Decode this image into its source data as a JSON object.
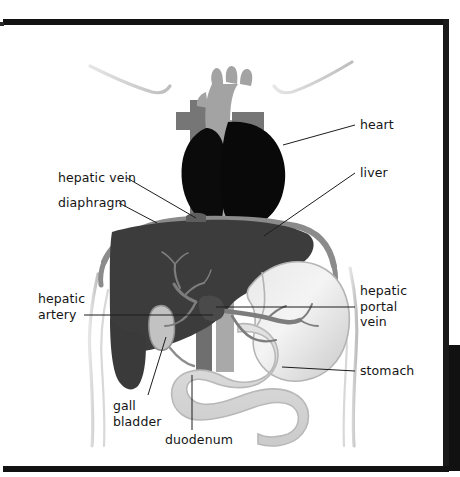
{
  "figure": {
    "type": "anatomical-diagram",
    "view": "anterior torso, frontal section"
  },
  "labels": [
    {
      "id": "heart",
      "text": "heart",
      "side": "right",
      "x": 360,
      "y": 117,
      "leader": {
        "x1": 355,
        "y1": 125,
        "x2": 283,
        "y2": 145
      }
    },
    {
      "id": "liver",
      "text": "liver",
      "side": "right",
      "x": 360,
      "y": 165,
      "leader": {
        "x1": 355,
        "y1": 173,
        "x2": 264,
        "y2": 236
      }
    },
    {
      "id": "hepatic-vein",
      "text": "hepatic vein",
      "side": "left",
      "x": 58,
      "y": 170,
      "leader": {
        "x1": 127,
        "y1": 178,
        "x2": 196,
        "y2": 218
      }
    },
    {
      "id": "diaphragm",
      "text": "diaphragm",
      "side": "left",
      "x": 58,
      "y": 195,
      "leader": {
        "x1": 119,
        "y1": 203,
        "x2": 157,
        "y2": 223
      }
    },
    {
      "id": "hepatic-artery",
      "text": "hepatic\nartery",
      "side": "left",
      "x": 38,
      "y": 291,
      "leader": {
        "x1": 84,
        "y1": 315,
        "x2": 213,
        "y2": 315
      }
    },
    {
      "id": "hepatic-portal-vein",
      "text": "hepatic\nportal\nvein",
      "side": "right",
      "x": 360,
      "y": 283,
      "leader": {
        "x1": 355,
        "y1": 307,
        "x2": 216,
        "y2": 307
      }
    },
    {
      "id": "stomach",
      "text": "stomach",
      "side": "right",
      "x": 360,
      "y": 363,
      "leader": {
        "x1": 355,
        "y1": 371,
        "x2": 282,
        "y2": 367
      }
    },
    {
      "id": "gall-bladder",
      "text": "gall\nbladder",
      "side": "left",
      "x": 113,
      "y": 398,
      "leader": {
        "x1": 148,
        "y1": 395,
        "x2": 166,
        "y2": 337
      }
    },
    {
      "id": "duodenum",
      "text": "duodenum",
      "side": "left",
      "x": 165,
      "y": 432,
      "leader": {
        "x1": 192,
        "y1": 430,
        "x2": 192,
        "y2": 375
      }
    }
  ],
  "organs": [
    {
      "id": "heart",
      "name": "heart",
      "fill": "#0a0a0a"
    },
    {
      "id": "aortic-arch",
      "name": "aortic arch",
      "fill": "#9a9a9a"
    },
    {
      "id": "vena-cava",
      "name": "superior vena cava",
      "fill": "#6f6f6f"
    },
    {
      "id": "aorta",
      "name": "descending aorta",
      "fill": "#a6a6a6"
    },
    {
      "id": "liver",
      "name": "liver",
      "fill": "#3b3b3b"
    },
    {
      "id": "diaphragm",
      "name": "diaphragm",
      "fill": "#8d8d8d"
    },
    {
      "id": "stomach",
      "name": "stomach",
      "fill": "#dcdcdc"
    },
    {
      "id": "duodenum",
      "name": "duodenum",
      "fill": "#d4d4d4"
    },
    {
      "id": "gall-bladder",
      "name": "gall bladder",
      "fill": "#bdbdbd"
    },
    {
      "id": "portal-vessels",
      "name": "hepatic portal vessels",
      "fill": "#7d7d7d"
    },
    {
      "id": "body-outline",
      "name": "torso outline",
      "fill": "#cfcfcf"
    }
  ],
  "colors": {
    "page": "#ffffff",
    "frame": "#121212",
    "text": "#141414",
    "leader": "#1d1d1d"
  }
}
